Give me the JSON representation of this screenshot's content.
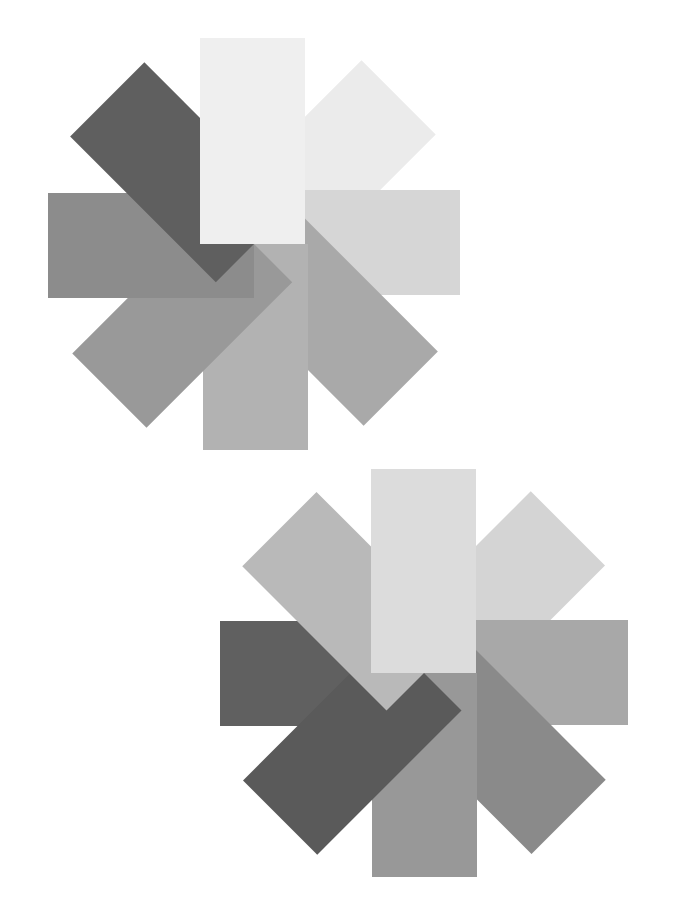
{
  "canvas": {
    "width": 683,
    "height": 917,
    "background": "#ffffff"
  },
  "figures": [
    {
      "name": "pinwheel-top",
      "center": [
        254,
        244
      ],
      "blade": {
        "left": -54,
        "right": 51,
        "length": 206
      },
      "blades": [
        {
          "angle": 0,
          "color": "#efefef",
          "order": 8
        },
        {
          "angle": 45,
          "color": "#ebebeb",
          "order": 1
        },
        {
          "angle": 90,
          "color": "#d6d6d6",
          "order": 2
        },
        {
          "angle": 135,
          "color": "#a9a9a9",
          "order": 3
        },
        {
          "angle": 180,
          "color": "#b2b2b2",
          "order": 4
        },
        {
          "angle": 225,
          "color": "#999999",
          "order": 5
        },
        {
          "angle": 270,
          "color": "#8c8c8c",
          "order": 6
        },
        {
          "angle": 315,
          "color": "#5f5f5f",
          "order": 7
        }
      ]
    },
    {
      "name": "pinwheel-bottom",
      "center": [
        424,
        673
      ],
      "blade": {
        "left": -53,
        "right": 52,
        "length": 204
      },
      "blades": [
        {
          "angle": 0,
          "color": "#dcdcdc",
          "order": 8
        },
        {
          "angle": 45,
          "color": "#d4d4d4",
          "order": 1
        },
        {
          "angle": 90,
          "color": "#a8a8a8",
          "order": 2
        },
        {
          "angle": 135,
          "color": "#8a8a8a",
          "order": 3
        },
        {
          "angle": 180,
          "color": "#989898",
          "order": 4
        },
        {
          "angle": 225,
          "color": "#5a5a5a",
          "order": 6
        },
        {
          "angle": 270,
          "color": "#606060",
          "order": 5
        },
        {
          "angle": 315,
          "color": "#b9b9b9",
          "order": 7
        }
      ]
    }
  ]
}
